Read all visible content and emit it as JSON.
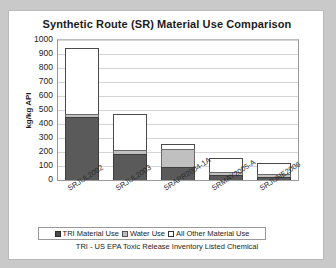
{
  "chart_data": {
    "type": "bar",
    "subtype": "stacked",
    "title": "Synthetic Route (SR) Material Use Comparison",
    "xlabel": "",
    "ylabel": "kg/kg API",
    "ylim": [
      0,
      1000
    ],
    "ytick_step": 100,
    "yticks": [
      1000,
      900,
      800,
      700,
      600,
      500,
      400,
      300,
      200,
      100,
      0
    ],
    "grid": true,
    "legend_position": "bottom",
    "categories": [
      "SRJUL2002",
      "SRJUL2003",
      "SRAPR2004-1A",
      "SRMAY2005-A",
      "SRJUNE2006"
    ],
    "series": [
      {
        "name": "TRI Material Use",
        "values": [
          450,
          185,
          90,
          35,
          20
        ]
      },
      {
        "name": "Water Use",
        "values": [
          20,
          30,
          135,
          25,
          25
        ]
      },
      {
        "name": "All Other Material Use",
        "values": [
          470,
          255,
          30,
          100,
          75
        ]
      }
    ],
    "totals": [
      940,
      470,
      255,
      160,
      120
    ],
    "annotations": [
      "TRI - US EPA Toxic Release Inventory Listed Chemical"
    ],
    "colors": {
      "tri": "#5a5a5a",
      "water": "#c0c0c0",
      "other": "#ffffff",
      "grid": "#d4d4d4",
      "axis": "#9a9a9a",
      "text": "#1c1c1c",
      "page_background": "#c9c9c9",
      "chart_background": "#ffffff"
    }
  },
  "footnote": "TRI - US EPA Toxic Release Inventory Listed Chemical"
}
